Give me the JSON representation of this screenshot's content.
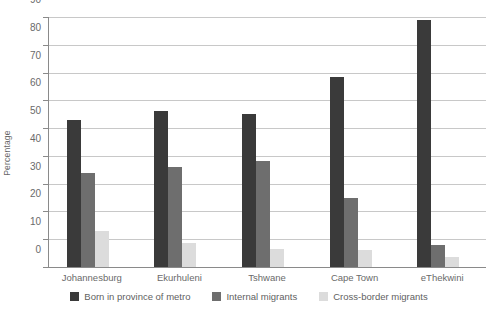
{
  "chart_data": {
    "type": "bar",
    "title": "",
    "xlabel": "",
    "ylabel": "Percentage",
    "ylim": [
      0,
      90
    ],
    "yticks": [
      0,
      10,
      20,
      30,
      40,
      50,
      60,
      70,
      80,
      90
    ],
    "grid": true,
    "legend_position": "bottom",
    "categories": [
      "Johannesburg",
      "Ekurhuleni",
      "Tshwane",
      "Cape Town",
      "eThekwini"
    ],
    "series": [
      {
        "name": "Born in province of metro",
        "color": "#3a3a3a",
        "values": [
          53,
          56,
          55,
          68.5,
          89
        ]
      },
      {
        "name": "Internal migrants",
        "color": "#6e6e6e",
        "values": [
          34,
          36,
          38,
          25,
          8
        ]
      },
      {
        "name": "Cross-border migrants",
        "color": "#dcdcdc",
        "values": [
          13,
          8.5,
          6.5,
          6,
          3.5
        ]
      }
    ]
  },
  "axis": {
    "y_title": "Percentage",
    "y_tick_labels": [
      "0",
      "10",
      "20",
      "30",
      "40",
      "50",
      "60",
      "70",
      "80",
      "90"
    ],
    "x_tick_labels": [
      "Johannesburg",
      "Ekurhuleni",
      "Tshwane",
      "Cape Town",
      "eThekwini"
    ]
  },
  "legend": {
    "items": [
      {
        "label": "Born in province of metro",
        "swatch": "#3a3a3a"
      },
      {
        "label": "Internal migrants",
        "swatch": "#6e6e6e"
      },
      {
        "label": "Cross-border migrants",
        "swatch": "#dcdcdc"
      }
    ]
  },
  "colors": {
    "gridline": "#c8c8c8",
    "axis": "#8a8a8a",
    "text": "#6a6a6a",
    "background": "#ffffff"
  }
}
